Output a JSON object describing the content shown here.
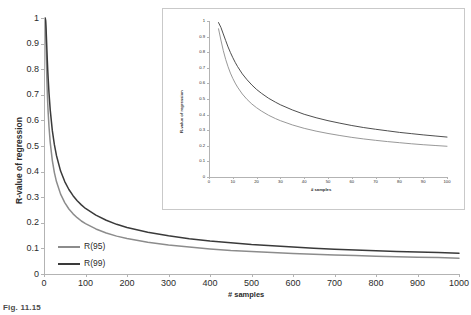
{
  "figure": {
    "caption_stub": "Fig. 11.15",
    "background_color": "#ffffff"
  },
  "colors": {
    "r95": "#8c8c8c",
    "r99": "#3a3a3a",
    "axis": "#b3b3b3",
    "text": "#2b2b2b",
    "inset_border": "#c9c9c9"
  },
  "chart_data": [
    {
      "id": "main",
      "type": "line",
      "title": "",
      "xlabel": "# samples",
      "ylabel": "R-value of regression",
      "xlim": [
        0,
        1000
      ],
      "ylim": [
        0,
        1
      ],
      "grid": false,
      "legend_position": "inside-lower-left",
      "xticks": [
        0,
        100,
        200,
        300,
        400,
        500,
        600,
        700,
        800,
        900,
        1000
      ],
      "xticklabels": [
        "0",
        "100",
        "200",
        "300",
        "400",
        "500",
        "600",
        "700",
        "800",
        "900",
        "1000"
      ],
      "yticks": [
        0,
        0.1,
        0.2,
        0.3,
        0.4,
        0.5,
        0.6,
        0.7,
        0.8,
        0.9,
        1
      ],
      "yticklabels": [
        "0",
        "0.1",
        "0.2",
        "0.3",
        "0.4",
        "0.5",
        "0.6",
        "0.7",
        "0.8",
        "0.9",
        "1"
      ],
      "x": [
        3,
        4,
        5,
        6,
        7,
        8,
        9,
        10,
        12,
        15,
        20,
        25,
        30,
        40,
        50,
        60,
        70,
        80,
        90,
        100,
        125,
        150,
        175,
        200,
        250,
        300,
        350,
        400,
        450,
        500,
        550,
        600,
        650,
        700,
        750,
        800,
        850,
        900,
        950,
        1000
      ],
      "series": [
        {
          "name": "R(95)",
          "color": "#8c8c8c",
          "values": [
            0.997,
            0.95,
            0.878,
            0.811,
            0.754,
            0.707,
            0.666,
            0.632,
            0.576,
            0.514,
            0.444,
            0.396,
            0.361,
            0.312,
            0.279,
            0.254,
            0.235,
            0.22,
            0.207,
            0.197,
            0.176,
            0.16,
            0.148,
            0.139,
            0.124,
            0.113,
            0.105,
            0.098,
            0.092,
            0.088,
            0.084,
            0.08,
            0.077,
            0.074,
            0.072,
            0.069,
            0.067,
            0.065,
            0.064,
            0.062
          ]
        },
        {
          "name": "R(99)",
          "color": "#3a3a3a",
          "values": [
            1.0,
            0.99,
            0.959,
            0.917,
            0.875,
            0.834,
            0.798,
            0.765,
            0.708,
            0.641,
            0.561,
            0.505,
            0.463,
            0.402,
            0.361,
            0.33,
            0.306,
            0.286,
            0.27,
            0.256,
            0.23,
            0.21,
            0.194,
            0.182,
            0.163,
            0.149,
            0.138,
            0.129,
            0.122,
            0.115,
            0.11,
            0.105,
            0.101,
            0.097,
            0.094,
            0.091,
            0.088,
            0.086,
            0.084,
            0.081
          ]
        }
      ],
      "legend": [
        {
          "label": "R(95)",
          "color": "#8c8c8c"
        },
        {
          "label": "R(99)",
          "color": "#3a3a3a"
        }
      ]
    },
    {
      "id": "inset",
      "type": "line",
      "title": "",
      "xlabel": "# samples",
      "ylabel": "R-value of regression",
      "xlim": [
        0,
        100
      ],
      "ylim": [
        0,
        1
      ],
      "grid": false,
      "legend_position": "none",
      "xticks": [
        0,
        10,
        20,
        30,
        40,
        50,
        60,
        70,
        80,
        90,
        100
      ],
      "xticklabels": [
        "0",
        "10",
        "20",
        "30",
        "40",
        "50",
        "60",
        "70",
        "80",
        "90",
        "100"
      ],
      "yticks": [
        0,
        0.1,
        0.2,
        0.3,
        0.4,
        0.5,
        0.6,
        0.7,
        0.8,
        0.9,
        1
      ],
      "yticklabels": [
        "0",
        "0.1",
        "0.2",
        "0.3",
        "0.4",
        "0.5",
        "0.6",
        "0.7",
        "0.8",
        "0.9",
        "1"
      ],
      "x": [
        4,
        5,
        6,
        7,
        8,
        9,
        10,
        11,
        12,
        14,
        16,
        18,
        20,
        22,
        25,
        28,
        30,
        35,
        40,
        45,
        50,
        55,
        60,
        65,
        70,
        75,
        80,
        85,
        90,
        95,
        100
      ],
      "series": [
        {
          "name": "R(95)",
          "color": "#8c8c8c",
          "values": [
            0.95,
            0.878,
            0.811,
            0.754,
            0.707,
            0.666,
            0.632,
            0.602,
            0.576,
            0.532,
            0.497,
            0.468,
            0.444,
            0.423,
            0.396,
            0.374,
            0.361,
            0.334,
            0.312,
            0.294,
            0.279,
            0.266,
            0.254,
            0.244,
            0.235,
            0.227,
            0.22,
            0.213,
            0.207,
            0.202,
            0.197
          ]
        },
        {
          "name": "R(99)",
          "color": "#3a3a3a",
          "values": [
            0.99,
            0.959,
            0.917,
            0.875,
            0.834,
            0.798,
            0.765,
            0.735,
            0.708,
            0.661,
            0.623,
            0.59,
            0.561,
            0.537,
            0.505,
            0.479,
            0.463,
            0.43,
            0.402,
            0.38,
            0.361,
            0.345,
            0.33,
            0.317,
            0.306,
            0.296,
            0.286,
            0.278,
            0.27,
            0.263,
            0.256
          ]
        }
      ]
    }
  ]
}
